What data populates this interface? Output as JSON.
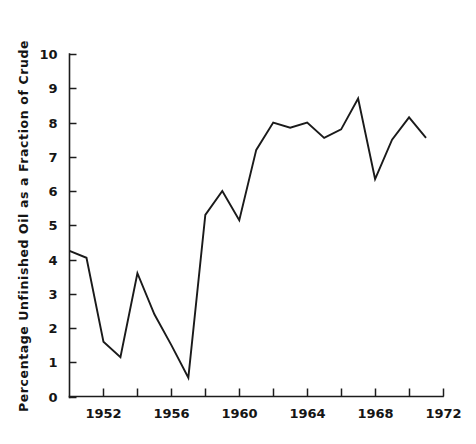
{
  "chart_data": {
    "type": "line",
    "title": "",
    "xlabel": "",
    "ylabel": "Percentage  Unfinished  Oil  as  a  Fraction  of  Crude",
    "xlim": [
      1950,
      1972
    ],
    "ylim": [
      0,
      10
    ],
    "grid": false,
    "legend": "none",
    "x_tick_labels": [
      "1952",
      "1956",
      "1960",
      "1964",
      "1968",
      "1972"
    ],
    "x_tick_values": [
      1952,
      1956,
      1960,
      1964,
      1968,
      1972
    ],
    "x_minor_tick_values": [
      1950,
      1954,
      1958,
      1962,
      1966,
      1970
    ],
    "y_tick_labels": [
      "0",
      "1",
      "2",
      "3",
      "4",
      "5",
      "6",
      "7",
      "8",
      "9",
      "10"
    ],
    "y_tick_values": [
      0,
      1,
      2,
      3,
      4,
      5,
      6,
      7,
      8,
      9,
      10
    ],
    "x": [
      1950,
      1951,
      1952,
      1953,
      1954,
      1955,
      1956,
      1957,
      1958,
      1959,
      1960,
      1961,
      1962,
      1963,
      1964,
      1965,
      1966,
      1967,
      1968,
      1969,
      1970,
      1971
    ],
    "values": [
      4.25,
      4.05,
      1.6,
      1.15,
      3.6,
      2.4,
      1.5,
      0.55,
      5.3,
      6.0,
      5.15,
      7.2,
      8.0,
      7.85,
      8.0,
      7.55,
      7.8,
      8.7,
      6.35,
      7.5,
      8.15,
      7.55
    ],
    "series": [
      {
        "name": "Percentage Unfinished Oil as a Fraction of Crude",
        "values": [
          4.25,
          4.05,
          1.6,
          1.15,
          3.6,
          2.4,
          1.5,
          0.55,
          5.3,
          6.0,
          5.15,
          7.2,
          8.0,
          7.85,
          8.0,
          7.55,
          7.8,
          8.7,
          6.35,
          7.5,
          8.15,
          7.55
        ]
      }
    ],
    "line_color": "#1a1a1a"
  }
}
